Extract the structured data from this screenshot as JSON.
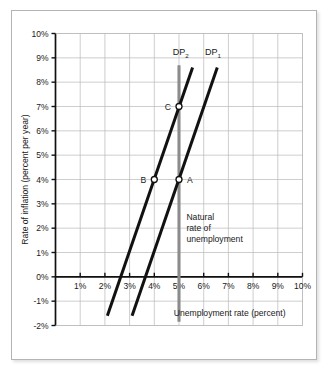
{
  "chart_data": {
    "type": "line",
    "title": "",
    "xlabel": "Unemployment rate  (percent)",
    "ylabel": "Rate of inflation (percent per year)",
    "xlim": [
      0,
      10
    ],
    "ylim": [
      -2,
      10
    ],
    "grid": true,
    "legend_position": "inline-curve-labels",
    "x_ticks": [
      "1%",
      "2%",
      "3%",
      "4%",
      "5%",
      "6%",
      "7%",
      "8%",
      "9%",
      "10%"
    ],
    "x_tick_values": [
      1,
      2,
      3,
      4,
      5,
      6,
      7,
      8,
      9,
      10
    ],
    "y_ticks": [
      "10%",
      "9%",
      "8%",
      "7%",
      "6%",
      "5%",
      "4%",
      "3%",
      "2%",
      "1%",
      "0%",
      "-1%",
      "-2%"
    ],
    "y_tick_values": [
      10,
      9,
      8,
      7,
      6,
      5,
      4,
      3,
      2,
      1,
      0,
      -1,
      -2
    ],
    "series": [
      {
        "name": "DP2",
        "label": "DP",
        "subscript": "2",
        "color": "#111111",
        "x": [
          2.1,
          5.55
        ],
        "y": [
          -1.6,
          8.6
        ],
        "label_x": 4.75,
        "label_y": 9.1
      },
      {
        "name": "DP1",
        "label": "DP",
        "subscript": "1",
        "color": "#111111",
        "x": [
          3.1,
          6.55
        ],
        "y": [
          -1.6,
          8.6
        ],
        "label_x": 6.05,
        "label_y": 9.1
      }
    ],
    "points": [
      {
        "label": "A",
        "x": 5,
        "y": 4,
        "label_side": "right",
        "series": "DP1"
      },
      {
        "label": "B",
        "x": 4,
        "y": 4,
        "label_side": "left",
        "series": "DP2"
      },
      {
        "label": "C",
        "x": 5,
        "y": 7,
        "label_side": "left",
        "series": "DP2"
      }
    ],
    "vertical_line": {
      "name": "natural-rate-line",
      "x": 5,
      "y_top": 8.7,
      "y_bottom": -1.85,
      "color": "#8c8c8c"
    },
    "annotations": [
      {
        "name": "natural-rate-annotation",
        "lines": [
          "Natural",
          "rate of",
          "unemployment"
        ],
        "x": 5.3,
        "y": 2.35
      }
    ]
  },
  "axes": {
    "x_axis_label": "Unemployment rate  (percent)",
    "y_axis_label": "Rate of inflation (percent per year)"
  }
}
